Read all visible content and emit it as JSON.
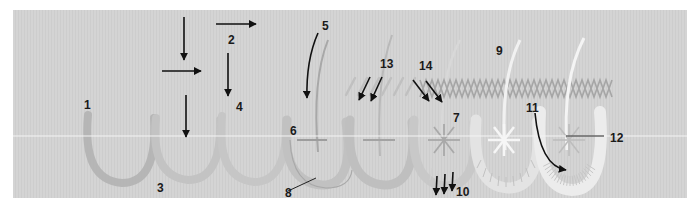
{
  "figure": {
    "type": "stitch-sequence-diagram",
    "colors": {
      "background_panel": "#d3d3d3",
      "page": "#ffffff",
      "arrow": "#111111",
      "label": "#1a1a1a",
      "scallop_padding": "#b9b9b9",
      "scallop_light": "#c4c4c4",
      "thread_white": "#f4f4f4",
      "thread_grey": "#9e9e9e",
      "divider_line": "#f2f2f2"
    },
    "stages": [
      {
        "index": 1,
        "description": "outline scallop"
      },
      {
        "index": 2,
        "description": "padding scallop"
      },
      {
        "index": 3,
        "description": "padding scallop"
      },
      {
        "index": 4,
        "description": "needle curve with cross stitch"
      },
      {
        "index": 5,
        "description": "needle curve with cross stitch"
      },
      {
        "index": 6,
        "description": "star stitch"
      },
      {
        "index": 7,
        "description": "white star with herringbone"
      },
      {
        "index": 8,
        "description": "buttonhole-covered scallop with star"
      }
    ]
  },
  "labels": [
    {
      "id": "1",
      "text": "1"
    },
    {
      "id": "2",
      "text": "2"
    },
    {
      "id": "3",
      "text": "3"
    },
    {
      "id": "4",
      "text": "4"
    },
    {
      "id": "5",
      "text": "5"
    },
    {
      "id": "6",
      "text": "6"
    },
    {
      "id": "7",
      "text": "7"
    },
    {
      "id": "8",
      "text": "8"
    },
    {
      "id": "9",
      "text": "9"
    },
    {
      "id": "10",
      "text": "10"
    },
    {
      "id": "11",
      "text": "11"
    },
    {
      "id": "12",
      "text": "12"
    },
    {
      "id": "13",
      "text": "13"
    },
    {
      "id": "14",
      "text": "14"
    }
  ]
}
